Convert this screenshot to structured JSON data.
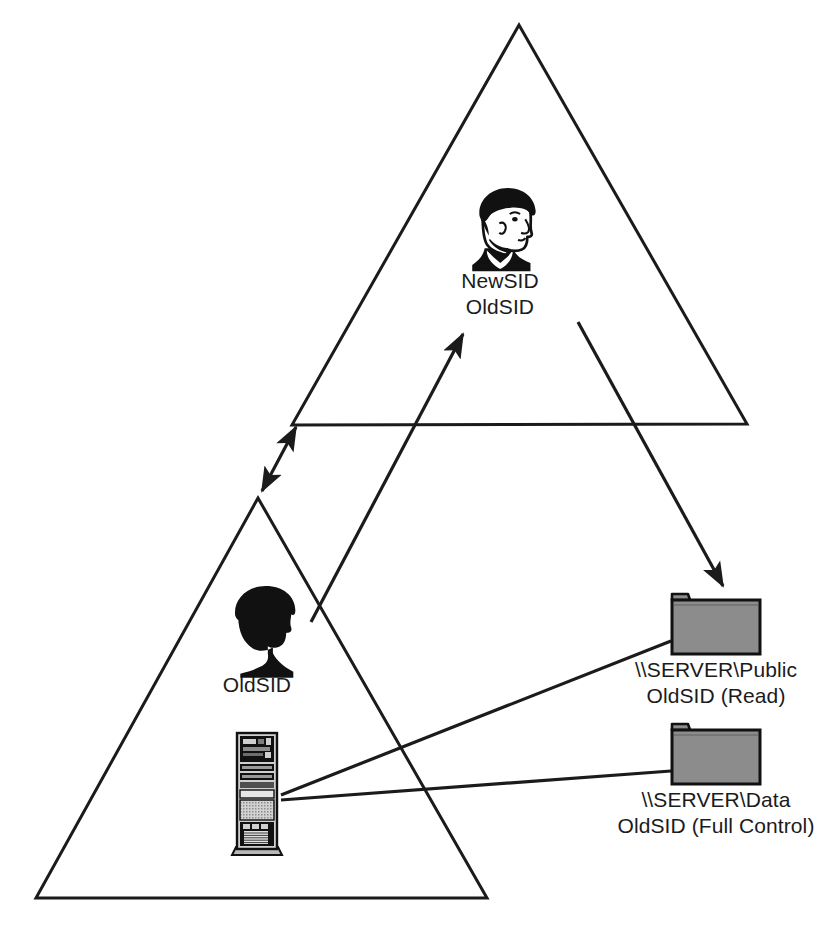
{
  "diagram": {
    "colors": {
      "stroke": "#1b1b1b",
      "folder_fill": "#8c8c8c",
      "folder_tab": "#8c8c8c",
      "background": "#ffffff"
    },
    "shapes": {
      "target_domain_triangle": {
        "name": "target-domain-triangle",
        "apex": [
          519,
          25
        ],
        "left": [
          292,
          425
        ],
        "right": [
          747,
          424
        ]
      },
      "source_domain_triangle": {
        "name": "source-domain-triangle",
        "apex": [
          258,
          498
        ],
        "left": [
          36,
          898
        ],
        "right": [
          487,
          898
        ]
      }
    },
    "nodes": [
      {
        "id": "new-user",
        "icon": "person-head-outline-icon",
        "x": 500,
        "y": 190,
        "label_lines": [
          "NewSID",
          "OldSID"
        ],
        "label_x": 500,
        "label_y": 268
      },
      {
        "id": "old-user",
        "icon": "person-head-silhouette-icon",
        "x": 257,
        "y": 600,
        "label_lines": [
          "OldSID"
        ],
        "label_x": 257,
        "label_y": 672
      },
      {
        "id": "file-server",
        "icon": "server-tower-icon",
        "x": 256,
        "y": 790,
        "label_lines": [],
        "label_x": 256,
        "label_y": 860
      },
      {
        "id": "share-public",
        "icon": "folder-icon",
        "x": 715,
        "y": 625,
        "label_lines": [
          "\\\\SERVER\\Public",
          "OldSID (Read)"
        ],
        "label_x": 716,
        "label_y": 657
      },
      {
        "id": "share-data",
        "icon": "folder-icon",
        "x": 715,
        "y": 755,
        "label_lines": [
          "\\\\SERVER\\Data",
          "OldSID (Full Control)"
        ],
        "label_x": 716,
        "label_y": 787
      }
    ],
    "connectors": [
      {
        "id": "domain-trust",
        "kind": "double-arrow",
        "from": [
          296,
          427
        ],
        "to": [
          262,
          491
        ]
      },
      {
        "id": "sid-migration",
        "kind": "arrow",
        "from": [
          311,
          622
        ],
        "to": [
          463,
          334
        ]
      },
      {
        "id": "access-public",
        "kind": "arrow",
        "from": [
          578,
          322
        ],
        "to": [
          723,
          586
        ]
      },
      {
        "id": "server-to-public",
        "kind": "plain",
        "from": [
          281,
          796
        ],
        "to": [
          671,
          640
        ]
      },
      {
        "id": "server-to-data",
        "kind": "plain",
        "from": [
          281,
          800
        ],
        "to": [
          671,
          771
        ]
      }
    ]
  }
}
